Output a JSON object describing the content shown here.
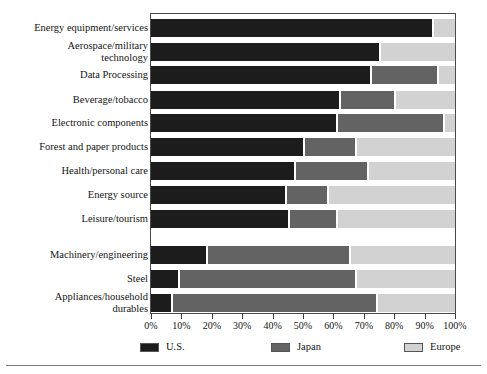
{
  "chart_data": {
    "type": "bar",
    "orientation": "horizontal",
    "stacked": true,
    "title": "",
    "subtitle": "",
    "xlabel": "",
    "ylabel": "",
    "xlim": [
      0,
      100
    ],
    "xunit": "%",
    "grid": false,
    "legend_position": "bottom",
    "categories": [
      "Energy equipment/services",
      "Aerospace/military\ntechnology",
      "Data Processing",
      "Beverage/tobacco",
      "Electronic components",
      "Forest and paper products",
      "Health/personal care",
      "Energy source",
      "Leisure/tourism",
      "Machinery/engineering",
      "Steel",
      "Appliances/household\ndurables"
    ],
    "series": [
      {
        "name": "U.S.",
        "color": "#1c1c1c",
        "values": [
          92.5,
          75,
          72,
          62,
          61,
          50,
          47,
          44,
          45,
          18,
          9,
          6.5
        ]
      },
      {
        "name": "Japan",
        "color": "#636363",
        "values": [
          0,
          0,
          22,
          18,
          35,
          17,
          24,
          14,
          16,
          47,
          58,
          67.5
        ]
      },
      {
        "name": "Europe",
        "color": "#d2d2d2",
        "values": [
          7.5,
          25,
          6,
          20,
          4,
          33,
          29,
          42,
          39,
          35,
          33,
          26
        ]
      }
    ],
    "xticks": [
      0,
      10,
      20,
      30,
      40,
      50,
      60,
      70,
      80,
      90,
      100
    ],
    "xticklabels": [
      "0%",
      "10%",
      "20%",
      "30%",
      "40%",
      "50%",
      "60%",
      "70%",
      "80%",
      "90%",
      "100%"
    ],
    "annotations": []
  },
  "legend": {
    "entries": [
      {
        "label": "U.S.",
        "color": "#1c1c1c"
      },
      {
        "label": "Japan",
        "color": "#636363"
      },
      {
        "label": "Europe",
        "color": "#d2d2d2"
      }
    ]
  }
}
